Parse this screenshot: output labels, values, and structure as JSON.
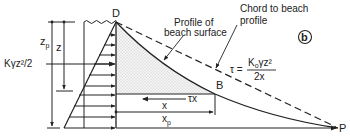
{
  "diagram": {
    "panel_label": "b",
    "points": {
      "D": "D",
      "B": "B",
      "P": "P"
    },
    "labels": {
      "zp_main": "z",
      "zp_sub": "p",
      "z": "z",
      "force": "Kγz²/2",
      "profile_line1": "Profile of",
      "profile_line2": "beach surface",
      "chord_line1": "Chord to beach",
      "chord_line2": "profile",
      "tau_lhs": "τ =",
      "tau_num_K": "K",
      "tau_num_sub": "o",
      "tau_num_rest": "γz²",
      "tau_den": "2x",
      "tau_x": "τx",
      "x": "x",
      "xp_main": "x",
      "xp_sub": "p"
    },
    "colors": {
      "line": "#222222",
      "stipple": "#bdbdbd"
    }
  }
}
